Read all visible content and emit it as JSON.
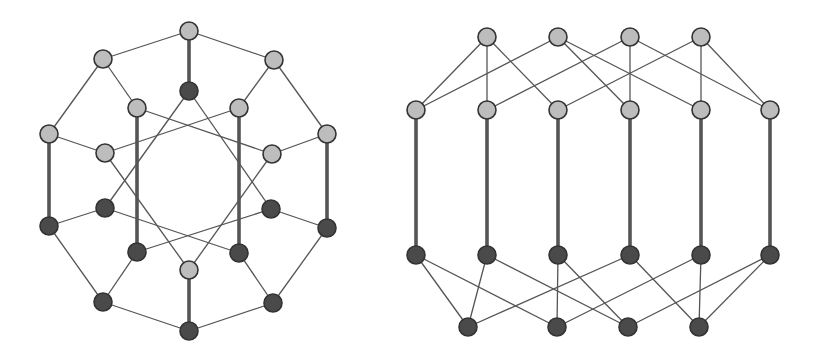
{
  "style": {
    "background": "#ffffff",
    "light_node_fill": "#bdbdbd",
    "dark_node_fill": "#4a4a4a",
    "node_stroke": "#333333",
    "edge_color": "#555555",
    "thin_edge_width": 1.3,
    "thick_edge_width": 3.6,
    "node_radius": 9
  },
  "graphs": [
    {
      "name": "left-graph-circular",
      "nodes": [
        {
          "id": "T",
          "x": 189,
          "y": 31,
          "shade": "light"
        },
        {
          "id": "UL",
          "x": 103,
          "y": 59,
          "shade": "light"
        },
        {
          "id": "UR",
          "x": 274,
          "y": 60,
          "shade": "light"
        },
        {
          "id": "IT",
          "x": 189,
          "y": 91,
          "shade": "dark"
        },
        {
          "id": "IUL",
          "x": 137,
          "y": 108,
          "shade": "light"
        },
        {
          "id": "IUR",
          "x": 239,
          "y": 108,
          "shade": "light"
        },
        {
          "id": "L",
          "x": 49,
          "y": 134,
          "shade": "light"
        },
        {
          "id": "R",
          "x": 327,
          "y": 134,
          "shade": "light"
        },
        {
          "id": "ML",
          "x": 105,
          "y": 153,
          "shade": "light"
        },
        {
          "id": "MR",
          "x": 272,
          "y": 154,
          "shade": "light"
        },
        {
          "id": "ML2",
          "x": 105,
          "y": 208,
          "shade": "dark"
        },
        {
          "id": "MR2",
          "x": 271,
          "y": 209,
          "shade": "dark"
        },
        {
          "id": "L2",
          "x": 49,
          "y": 226,
          "shade": "dark"
        },
        {
          "id": "R2",
          "x": 327,
          "y": 228,
          "shade": "dark"
        },
        {
          "id": "ILL",
          "x": 137,
          "y": 252,
          "shade": "dark"
        },
        {
          "id": "ILR",
          "x": 239,
          "y": 253,
          "shade": "dark"
        },
        {
          "id": "IB",
          "x": 189,
          "y": 270,
          "shade": "light"
        },
        {
          "id": "BL",
          "x": 103,
          "y": 302,
          "shade": "dark"
        },
        {
          "id": "BR",
          "x": 273,
          "y": 303,
          "shade": "dark"
        },
        {
          "id": "B",
          "x": 189,
          "y": 331,
          "shade": "dark"
        }
      ],
      "edges": [
        [
          "T",
          "UL",
          "thin"
        ],
        [
          "T",
          "UR",
          "thin"
        ],
        [
          "UL",
          "L",
          "thin"
        ],
        [
          "UR",
          "R",
          "thin"
        ],
        [
          "L2",
          "BL",
          "thin"
        ],
        [
          "BL",
          "B",
          "thin"
        ],
        [
          "B",
          "BR",
          "thin"
        ],
        [
          "BR",
          "R2",
          "thin"
        ],
        [
          "T",
          "IT",
          "thick"
        ],
        [
          "L",
          "L2",
          "thick"
        ],
        [
          "R",
          "R2",
          "thick"
        ],
        [
          "B",
          "IB",
          "thick"
        ],
        [
          "IUL",
          "ILL",
          "thick"
        ],
        [
          "IUR",
          "ILR",
          "thick"
        ],
        [
          "UL",
          "IUL",
          "thin"
        ],
        [
          "UR",
          "IUR",
          "thin"
        ],
        [
          "L",
          "ML",
          "thin"
        ],
        [
          "R",
          "MR",
          "thin"
        ],
        [
          "L2",
          "ML2",
          "thin"
        ],
        [
          "R2",
          "MR2",
          "thin"
        ],
        [
          "BL",
          "ILL",
          "thin"
        ],
        [
          "BR",
          "ILR",
          "thin"
        ],
        [
          "IT",
          "ML2",
          "thin"
        ],
        [
          "IT",
          "MR2",
          "thin"
        ],
        [
          "IUL",
          "MR",
          "thin"
        ],
        [
          "IUR",
          "ML",
          "thin"
        ],
        [
          "ML",
          "IB",
          "thin"
        ],
        [
          "MR",
          "IB",
          "thin"
        ],
        [
          "ML2",
          "ILR",
          "thin"
        ],
        [
          "MR2",
          "ILL",
          "thin"
        ]
      ]
    },
    {
      "name": "right-graph-layered",
      "nodes": [
        {
          "id": "T1",
          "x": 487,
          "y": 37,
          "shade": "light"
        },
        {
          "id": "T2",
          "x": 558,
          "y": 37,
          "shade": "light"
        },
        {
          "id": "T3",
          "x": 630,
          "y": 37,
          "shade": "light"
        },
        {
          "id": "T4",
          "x": 701,
          "y": 37,
          "shade": "light"
        },
        {
          "id": "M1",
          "x": 416,
          "y": 110,
          "shade": "light"
        },
        {
          "id": "M2",
          "x": 487,
          "y": 110,
          "shade": "light"
        },
        {
          "id": "M3",
          "x": 558,
          "y": 110,
          "shade": "light"
        },
        {
          "id": "M4",
          "x": 630,
          "y": 110,
          "shade": "light"
        },
        {
          "id": "M5",
          "x": 701,
          "y": 110,
          "shade": "light"
        },
        {
          "id": "M6",
          "x": 770,
          "y": 110,
          "shade": "light"
        },
        {
          "id": "D1",
          "x": 416,
          "y": 255,
          "shade": "dark"
        },
        {
          "id": "D2",
          "x": 487,
          "y": 255,
          "shade": "dark"
        },
        {
          "id": "D3",
          "x": 558,
          "y": 255,
          "shade": "dark"
        },
        {
          "id": "D4",
          "x": 630,
          "y": 255,
          "shade": "dark"
        },
        {
          "id": "D5",
          "x": 701,
          "y": 255,
          "shade": "dark"
        },
        {
          "id": "D6",
          "x": 770,
          "y": 255,
          "shade": "dark"
        },
        {
          "id": "B1",
          "x": 468,
          "y": 327,
          "shade": "dark"
        },
        {
          "id": "B2",
          "x": 557,
          "y": 327,
          "shade": "dark"
        },
        {
          "id": "B3",
          "x": 628,
          "y": 327,
          "shade": "dark"
        },
        {
          "id": "B4",
          "x": 699,
          "y": 327,
          "shade": "dark"
        }
      ],
      "edges": [
        [
          "T1",
          "M1",
          "thin"
        ],
        [
          "T1",
          "M2",
          "thin"
        ],
        [
          "T1",
          "M3",
          "thin"
        ],
        [
          "T2",
          "M1",
          "thin"
        ],
        [
          "T2",
          "M4",
          "thin"
        ],
        [
          "T2",
          "M5",
          "thin"
        ],
        [
          "T3",
          "M2",
          "thin"
        ],
        [
          "T3",
          "M4",
          "thin"
        ],
        [
          "T3",
          "M6",
          "thin"
        ],
        [
          "T4",
          "M3",
          "thin"
        ],
        [
          "T4",
          "M5",
          "thin"
        ],
        [
          "T4",
          "M6",
          "thin"
        ],
        [
          "M1",
          "D1",
          "thick"
        ],
        [
          "M2",
          "D2",
          "thick"
        ],
        [
          "M3",
          "D3",
          "thick"
        ],
        [
          "M4",
          "D4",
          "thick"
        ],
        [
          "M5",
          "D5",
          "thick"
        ],
        [
          "M6",
          "D6",
          "thick"
        ],
        [
          "D1",
          "B1",
          "thin"
        ],
        [
          "D1",
          "B2",
          "thin"
        ],
        [
          "D2",
          "B1",
          "thin"
        ],
        [
          "D2",
          "B3",
          "thin"
        ],
        [
          "D3",
          "B2",
          "thin"
        ],
        [
          "D3",
          "B3",
          "thin"
        ],
        [
          "D4",
          "B1",
          "thin"
        ],
        [
          "D4",
          "B4",
          "thin"
        ],
        [
          "D5",
          "B2",
          "thin"
        ],
        [
          "D5",
          "B4",
          "thin"
        ],
        [
          "D6",
          "B3",
          "thin"
        ],
        [
          "D6",
          "B4",
          "thin"
        ]
      ]
    }
  ]
}
